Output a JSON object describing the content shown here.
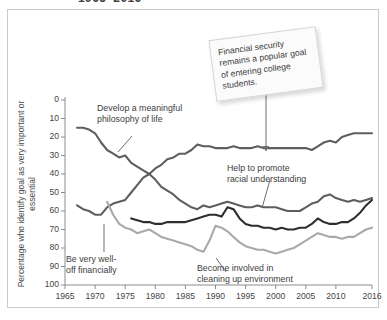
{
  "figure": {
    "title_partial": "1965–2016",
    "border_color": "#c9c9c9"
  },
  "callout": {
    "text": "Financial security remains a popular goal of entering college students."
  },
  "axis": {
    "y_title": "Percentage who identify goal as very important or essential",
    "y_ticks": [
      "100",
      "90",
      "80",
      "70",
      "60",
      "50",
      "40",
      "30",
      "20",
      "10",
      "0"
    ],
    "x_ticks": [
      "1965",
      "1970",
      "1975",
      "1980",
      "1985",
      "1990",
      "1995",
      "2000",
      "2005",
      "2010",
      "2016"
    ]
  },
  "annotations": {
    "philosophy": "Develop a meaningful\nphilosophy of life",
    "racial": "Help to promote\nracial understanding",
    "welloff": "Be very well-\noff financially",
    "environment": "Become involved in\ncleaning up environment"
  },
  "chart_data": {
    "type": "line",
    "title": "1965–2016",
    "xlabel": "",
    "ylabel": "Percentage who identify goal as very important or essential",
    "xlim": [
      1965,
      2016
    ],
    "ylim": [
      0,
      100
    ],
    "grid": false,
    "legend": "annotations-on-plot",
    "x_tick_values": [
      1965,
      1970,
      1975,
      1980,
      1985,
      1990,
      1995,
      2000,
      2005,
      2010,
      2016
    ],
    "y_tick_values": [
      0,
      10,
      20,
      30,
      40,
      50,
      60,
      70,
      80,
      90,
      100
    ],
    "series": [
      {
        "name": "Develop a meaningful philosophy of life",
        "color": "#5e5e5e",
        "x": [
          1967,
          1968,
          1969,
          1970,
          1971,
          1972,
          1973,
          1974,
          1975,
          1976,
          1977,
          1978,
          1979,
          1980,
          1981,
          1982,
          1983,
          1984,
          1985,
          1986,
          1987,
          1988,
          1989,
          1990,
          1991,
          1992,
          1993,
          1994,
          1995,
          1996,
          1997,
          1998,
          1999,
          2000,
          2001,
          2002,
          2003,
          2004,
          2005,
          2006,
          2007,
          2008,
          2009,
          2010,
          2011,
          2012,
          2013,
          2014,
          2015,
          2016
        ],
        "values": [
          85,
          85,
          84,
          82,
          77,
          73,
          71,
          69,
          70,
          66,
          64,
          62,
          60,
          57,
          53,
          51,
          49,
          46,
          44,
          42,
          41,
          43,
          42,
          43,
          44,
          45,
          44,
          43,
          42,
          42,
          43,
          42,
          42,
          42,
          41,
          40,
          40,
          40,
          42,
          44,
          45,
          48,
          49,
          47,
          46,
          45,
          46,
          45,
          46,
          47
        ]
      },
      {
        "name": "Be very well-off financially",
        "color": "#5e5e5e",
        "x": [
          1967,
          1968,
          1969,
          1970,
          1971,
          1972,
          1973,
          1974,
          1975,
          1976,
          1977,
          1978,
          1979,
          1980,
          1981,
          1982,
          1983,
          1984,
          1985,
          1986,
          1987,
          1988,
          1989,
          1990,
          1991,
          1992,
          1993,
          1994,
          1995,
          1996,
          1997,
          1998,
          1999,
          2000,
          2001,
          2002,
          2003,
          2004,
          2005,
          2006,
          2007,
          2008,
          2009,
          2010,
          2011,
          2012,
          2013,
          2014,
          2015,
          2016
        ],
        "values": [
          43,
          41,
          40,
          38,
          38,
          42,
          44,
          45,
          46,
          50,
          54,
          58,
          60,
          63,
          65,
          68,
          69,
          71,
          71,
          73,
          76,
          75,
          75,
          74,
          74,
          74,
          75,
          74,
          74,
          74,
          75,
          74,
          74,
          74,
          74,
          74,
          74,
          74,
          74,
          73,
          75,
          77,
          78,
          77,
          80,
          81,
          82,
          82,
          82,
          82
        ]
      },
      {
        "name": "Help to promote racial understanding",
        "color": "#2e2e2e",
        "x": [
          1976,
          1977,
          1978,
          1979,
          1980,
          1981,
          1982,
          1983,
          1984,
          1985,
          1986,
          1987,
          1988,
          1989,
          1990,
          1991,
          1992,
          1993,
          1994,
          1995,
          1996,
          1997,
          1998,
          1999,
          2000,
          2001,
          2002,
          2003,
          2004,
          2005,
          2006,
          2007,
          2008,
          2009,
          2010,
          2011,
          2012,
          2013,
          2014,
          2015,
          2016
        ],
        "values": [
          36,
          35,
          34,
          34,
          33,
          33,
          34,
          34,
          34,
          34,
          35,
          36,
          37,
          38,
          38,
          37,
          42,
          41,
          36,
          33,
          32,
          32,
          31,
          31,
          30,
          31,
          30,
          30,
          31,
          31,
          33,
          36,
          34,
          33,
          33,
          34,
          34,
          36,
          39,
          43,
          46
        ]
      },
      {
        "name": "Become involved in cleaning up environment",
        "color": "#a9a9a9",
        "x": [
          1972,
          1973,
          1974,
          1975,
          1976,
          1977,
          1978,
          1979,
          1980,
          1981,
          1982,
          1983,
          1984,
          1985,
          1986,
          1987,
          1988,
          1989,
          1990,
          1991,
          1992,
          1993,
          1994,
          1995,
          1996,
          1997,
          1998,
          1999,
          2000,
          2001,
          2002,
          2003,
          2004,
          2005,
          2006,
          2007,
          2008,
          2009,
          2010,
          2011,
          2012,
          2013,
          2014,
          2015,
          2016
        ],
        "values": [
          45,
          38,
          33,
          31,
          30,
          28,
          29,
          30,
          28,
          26,
          25,
          24,
          23,
          22,
          21,
          19,
          18,
          24,
          32,
          31,
          29,
          26,
          23,
          21,
          20,
          19,
          19,
          18,
          17,
          18,
          19,
          20,
          22,
          24,
          26,
          28,
          27,
          26,
          26,
          25,
          26,
          26,
          28,
          30,
          31
        ]
      }
    ]
  }
}
